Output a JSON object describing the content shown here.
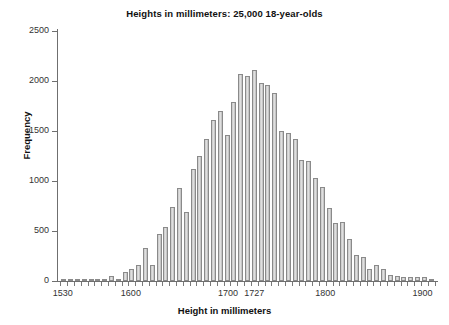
{
  "chart_data": {
    "type": "bar",
    "title": "Heights in millimeters: 25,000 18-year-olds",
    "xlabel": "Height in millimeters",
    "ylabel": "Frequency",
    "xlim": [
      1525,
      1915
    ],
    "ylim": [
      0,
      2500
    ],
    "grid": false,
    "legend": null,
    "bin_width": 7,
    "x_tick_labels": [
      "1530",
      "1600",
      "1700",
      "1727",
      "1800",
      "1900"
    ],
    "x_tick_values": [
      1530,
      1600,
      1700,
      1727,
      1800,
      1900
    ],
    "y_tick_labels": [
      "0",
      "500",
      "1000",
      "1500",
      "2000",
      "2500"
    ],
    "y_tick_values": [
      0,
      500,
      1000,
      1500,
      2000,
      2500
    ],
    "bar_color": "#dadada",
    "bar_edge_color": "#8a8a8a",
    "axis_color": "#6f6f6f",
    "x": [
      1531,
      1538,
      1545,
      1552,
      1559,
      1566,
      1573,
      1580,
      1587,
      1594,
      1601,
      1608,
      1615,
      1622,
      1629,
      1636,
      1643,
      1650,
      1657,
      1664,
      1671,
      1678,
      1685,
      1692,
      1699,
      1706,
      1713,
      1720,
      1727,
      1734,
      1741,
      1748,
      1755,
      1762,
      1769,
      1776,
      1783,
      1790,
      1797,
      1804,
      1811,
      1818,
      1825,
      1832,
      1839,
      1846,
      1853,
      1860,
      1867,
      1874,
      1881,
      1888,
      1895,
      1902,
      1909
    ],
    "values": [
      10,
      10,
      15,
      15,
      20,
      20,
      25,
      55,
      20,
      90,
      120,
      165,
      330,
      160,
      470,
      540,
      745,
      935,
      690,
      1120,
      1250,
      1425,
      1610,
      1700,
      1460,
      1790,
      2075,
      2050,
      2110,
      1980,
      1965,
      1880,
      1500,
      1480,
      1425,
      1210,
      1205,
      1030,
      940,
      730,
      580,
      590,
      420,
      265,
      240,
      120,
      160,
      120,
      60,
      55,
      45,
      45,
      45,
      40,
      25
    ]
  }
}
